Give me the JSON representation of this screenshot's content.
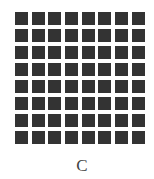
{
  "figure": {
    "label": "C",
    "grid": {
      "rows": 8,
      "columns": 8,
      "cell_color": "#333333",
      "background_color": "#ffffff"
    }
  }
}
